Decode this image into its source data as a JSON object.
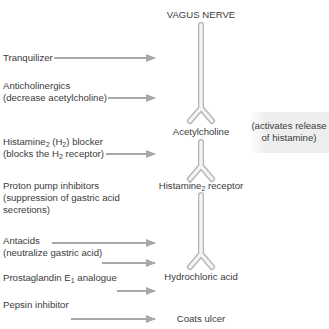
{
  "diagram": {
    "top_label": "VAGUS NERVE",
    "pathway_nodes": [
      {
        "id": "acetylcholine",
        "label": "Acetylcholine"
      },
      {
        "id": "histamine-receptor",
        "label_main": "Histamine",
        "label_sub": "2",
        "label_rest": " receptor"
      },
      {
        "id": "hydrochloric-acid",
        "label": "Hydrochloric acid"
      },
      {
        "id": "coats-ulcer",
        "label": "Coats ulcer"
      }
    ],
    "side_note": {
      "line1": "(activates release",
      "line2": "of histamine)"
    },
    "drugs": [
      {
        "id": "tranquilizer",
        "line1": "Tranquilizer"
      },
      {
        "id": "anticholinergics",
        "line1": "Anticholinergics",
        "line2": "(decrease acetylcholine)"
      },
      {
        "id": "h2-blocker",
        "line1_a": "Histamine",
        "line1_sub1": "2",
        "line1_b": " (H",
        "line1_sub2": "2",
        "line1_c": ") blocker",
        "line2_a": "(blocks the H",
        "line2_sub": "2",
        "line2_b": " receptor)"
      },
      {
        "id": "proton-pump-inhibitors",
        "line1": "Proton pump inhibitors",
        "line2": "(suppression of gastric acid",
        "line3": "secretions)"
      },
      {
        "id": "antacids",
        "line1": "Antacids",
        "line2": "(neutralize gastric acid)"
      },
      {
        "id": "prostaglandin",
        "line1_a": "Prostaglandin E",
        "line1_sub": "1",
        "line1_b": " analogue"
      },
      {
        "id": "pepsin-inhibitor",
        "line1": "Pepsin inhibitor"
      }
    ],
    "colors": {
      "arrow": "#a8a8a8",
      "nerve_outline": "#b5b5b5",
      "nerve_fill": "#f4f4f4",
      "text": "#3b3b3b",
      "note_bg": "#eeeeee"
    }
  }
}
